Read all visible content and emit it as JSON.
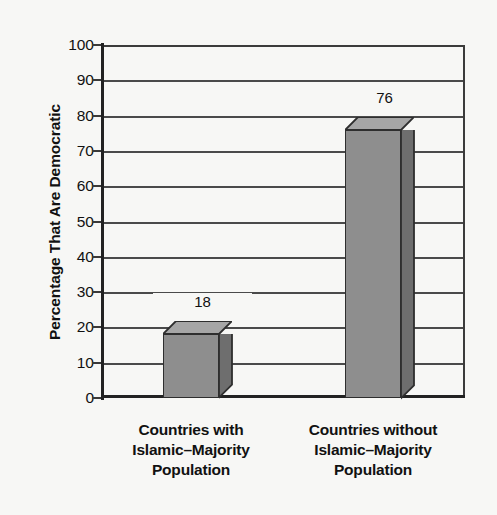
{
  "chart_data": {
    "type": "bar",
    "title": "",
    "subtitle": "",
    "xlabel": "",
    "ylabel": "Percentage That Are Democratic",
    "ylim": [
      0,
      100
    ],
    "ytick_step": 10,
    "yticks": [
      "100",
      "90",
      "80",
      "70",
      "60",
      "50",
      "40",
      "30",
      "20",
      "10",
      "0"
    ],
    "grid": true,
    "legend": "none",
    "style": "3d-column",
    "categories": [
      "Countries with Islamic–Majority Population",
      "Countries without Islamic–Majority Population"
    ],
    "category_lines": [
      [
        "Countries with",
        "Islamic–Majority",
        "Population"
      ],
      [
        "Countries without",
        "Islamic–Majority",
        "Population"
      ]
    ],
    "values": [
      18,
      76
    ],
    "value_labels": [
      "18",
      "76"
    ],
    "colors": {
      "bar_front": "#8e8e8e",
      "bar_top": "#a6a6a6",
      "bar_side": "#6e6e6e",
      "outline": "#2e2e2e",
      "gridline": "#4a4a4a",
      "axis": "#222222",
      "background": "#f7f7f5",
      "text": "#111111"
    }
  }
}
